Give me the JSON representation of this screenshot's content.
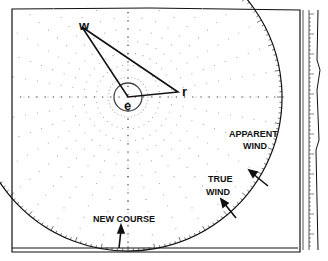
{
  "diagram": {
    "type": "maneuvering board wind vector plot",
    "points": {
      "w": {
        "label": "w",
        "x": 82,
        "y": 27
      },
      "e": {
        "label": "e",
        "x": 128,
        "y": 97
      },
      "r": {
        "label": "r",
        "x": 178,
        "y": 92
      }
    },
    "labels": {
      "apparent_wind": [
        "APPARENT",
        "WIND"
      ],
      "true_wind": [
        "TRUE",
        "WIND"
      ],
      "new_course": "NEW COURSE"
    },
    "colors": {
      "ink": "#111111",
      "dots": "#9a9a9a",
      "paper": "#ffffff"
    }
  }
}
